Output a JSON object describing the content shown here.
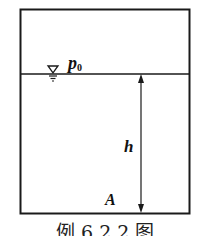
{
  "diagram": {
    "labels": {
      "pressure": "p",
      "pressure_sub": "0",
      "depth": "h",
      "point": "A"
    },
    "caption": "例 6.2.2 图",
    "colors": {
      "line": "#1a1a1a",
      "background": "#ffffff"
    }
  }
}
